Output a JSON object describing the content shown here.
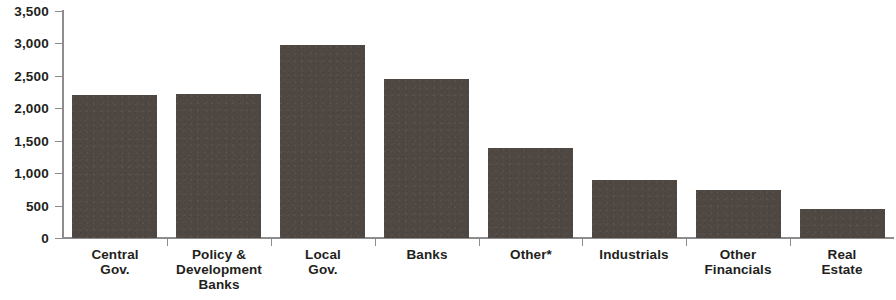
{
  "chart_data": {
    "type": "bar",
    "title": "",
    "subtitle": "",
    "xlabel": "",
    "ylabel": "",
    "categories": [
      "Central Gov.",
      "Policy & Development Banks",
      "Local Gov.",
      "Banks",
      "Other*",
      "Industrials",
      "Other Financials",
      "Real Estate"
    ],
    "category_lines": [
      [
        "Central",
        "Gov."
      ],
      [
        "Policy &",
        "Development",
        "Banks"
      ],
      [
        "Local",
        "Gov."
      ],
      [
        "Banks"
      ],
      [
        "Other*"
      ],
      [
        "Industrials"
      ],
      [
        "Other",
        "Financials"
      ],
      [
        "Real",
        "Estate"
      ]
    ],
    "values": [
      2200,
      2220,
      2980,
      2450,
      1380,
      900,
      740,
      440
    ],
    "ylim": [
      0,
      3500
    ],
    "ytick_values": [
      0,
      500,
      1000,
      1500,
      2000,
      2500,
      3000,
      3500
    ],
    "ytick_labels": [
      "0",
      "500",
      "1,000",
      "1,500",
      "2,000",
      "2,500",
      "3,000",
      "3,500"
    ],
    "grid": false,
    "legend": null,
    "bar_color": "#4e4742",
    "axis_color": "#8d8d8d",
    "text_color": "#231f20",
    "background_color": "#ffffff"
  }
}
